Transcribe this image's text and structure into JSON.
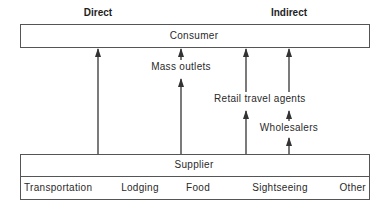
{
  "headers": {
    "direct": "Direct",
    "indirect": "Indirect"
  },
  "consumer": {
    "label": "Consumer"
  },
  "supplier": {
    "label": "Supplier",
    "categories": [
      "Transportation",
      "Lodging",
      "Food",
      "Sightseeing",
      "Other"
    ]
  },
  "intermediaries": {
    "mass_outlets": "Mass outlets",
    "retail_travel_agents": "Retail travel agents",
    "wholesalers": "Wholesalers"
  },
  "colors": {
    "line": "#333333",
    "border": "#555555",
    "text": "#2a2a2a"
  }
}
